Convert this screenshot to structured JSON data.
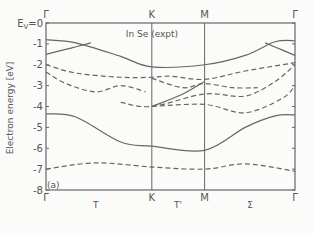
{
  "chart_data": {
    "type": "line",
    "title": "In Se (expt)",
    "panel_label": "(a)",
    "xlabel": "",
    "ylabel": "Electron energy [eV]",
    "ylim": [
      -8,
      0
    ],
    "yticks": [
      0,
      -1,
      -2,
      -3,
      -4,
      -5,
      -6,
      -7,
      -8
    ],
    "ytick_labels": [
      "E_V=0",
      "-1",
      "-2",
      "-3",
      "-4",
      "-5",
      "-6",
      "-7",
      "-8"
    ],
    "x_points": [
      {
        "label": "Γ",
        "pos": 0.0
      },
      {
        "label": "K",
        "pos": 0.425
      },
      {
        "label": "M",
        "pos": 0.637
      },
      {
        "label": "Γ",
        "pos": 1.0
      }
    ],
    "x_segment_labels": [
      {
        "label": "T",
        "pos": 0.2
      },
      {
        "label": "T'",
        "pos": 0.53
      },
      {
        "label": "Σ",
        "pos": 0.82
      }
    ],
    "grid": false,
    "series": [
      {
        "name": "band-1 solid",
        "style": "solid",
        "x": [
          0,
          0.12,
          0.3,
          0.425,
          0.637,
          0.8,
          0.92,
          1.0
        ],
        "y": [
          -0.8,
          -0.95,
          -1.6,
          -2.1,
          -2.0,
          -1.55,
          -0.9,
          -0.85
        ]
      },
      {
        "name": "band-2 solid",
        "style": "solid",
        "x": [
          0,
          0.1,
          0.18
        ],
        "y": [
          -1.5,
          -1.2,
          -0.95
        ]
      },
      {
        "name": "band-2b solid",
        "style": "solid",
        "x": [
          0.88,
          0.95,
          1.0
        ],
        "y": [
          -0.95,
          -1.3,
          -1.55
        ]
      },
      {
        "name": "band-3 dashed",
        "style": "dashed",
        "x": [
          0,
          0.12,
          0.3,
          0.425,
          0.5,
          0.637,
          0.8,
          1.0
        ],
        "y": [
          -2.0,
          -2.4,
          -2.6,
          -2.6,
          -2.55,
          -2.7,
          -2.3,
          -1.9
        ]
      },
      {
        "name": "band-4 dashed",
        "style": "dashed",
        "x": [
          0,
          0.08,
          0.2,
          0.3,
          0.4
        ],
        "y": [
          -2.35,
          -2.9,
          -3.3,
          -3.0,
          -3.3
        ]
      },
      {
        "name": "band-5 dashed",
        "style": "dashed",
        "x": [
          0.425,
          0.55,
          0.637,
          0.75,
          0.85
        ],
        "y": [
          -2.65,
          -3.1,
          -2.9,
          -3.1,
          -3.1
        ]
      },
      {
        "name": "band-6 dashed",
        "style": "dashed",
        "x": [
          0.3,
          0.425,
          0.637,
          0.8,
          0.92,
          1.0
        ],
        "y": [
          -3.8,
          -4.0,
          -3.4,
          -3.5,
          -2.8,
          -2.0
        ]
      },
      {
        "name": "band-7 solid",
        "style": "solid",
        "x": [
          0.425,
          0.55,
          0.637
        ],
        "y": [
          -4.0,
          -3.4,
          -2.8
        ]
      },
      {
        "name": "band-8 dashed",
        "style": "dashed",
        "x": [
          0.425,
          0.637,
          0.8,
          0.95,
          1.0
        ],
        "y": [
          -4.0,
          -3.9,
          -4.3,
          -3.6,
          -3.0
        ]
      },
      {
        "name": "band-9 solid",
        "style": "solid",
        "x": [
          0,
          0.12,
          0.3,
          0.425,
          0.637,
          0.8,
          0.92,
          1.0
        ],
        "y": [
          -4.35,
          -4.5,
          -5.7,
          -5.9,
          -6.1,
          -5.0,
          -4.45,
          -4.4
        ]
      },
      {
        "name": "band-10 dashed",
        "style": "dashed",
        "x": [
          0,
          0.2,
          0.425,
          0.637,
          0.8,
          1.0
        ],
        "y": [
          -7.0,
          -6.7,
          -6.9,
          -7.0,
          -6.75,
          -7.1
        ]
      }
    ]
  }
}
